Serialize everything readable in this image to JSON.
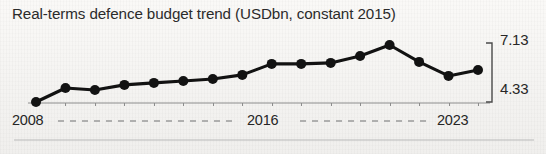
{
  "chart_data": {
    "type": "line",
    "title": "Real-terms defence budget trend (USDbn, constant 2015)",
    "xlabel": "",
    "ylabel": "",
    "grid": false,
    "legend": null,
    "axis_style": "right-bracket",
    "ylim": [
      4.33,
      7.13
    ],
    "y_tick_labels": [
      "4.33",
      "7.13"
    ],
    "x_tick_labels": [
      "2008",
      "2016",
      "2023"
    ],
    "x_tick_connector": "dashed",
    "categories": [
      "2008",
      "2009",
      "2010",
      "2011",
      "2012",
      "2013",
      "2014",
      "2015",
      "2016",
      "2017",
      "2018",
      "2019",
      "2020",
      "2021",
      "2022",
      "2023"
    ],
    "values": [
      4.33,
      5.02,
      4.92,
      5.17,
      5.27,
      5.36,
      5.46,
      5.66,
      6.2,
      6.2,
      6.25,
      6.59,
      7.13,
      6.3,
      5.61,
      5.9
    ],
    "series": [
      {
        "name": "Real-terms defence budget",
        "color": "#121212",
        "marker": "circle",
        "values": [
          4.33,
          5.02,
          4.92,
          5.17,
          5.27,
          5.36,
          5.46,
          5.66,
          6.2,
          6.2,
          6.25,
          6.59,
          7.13,
          6.3,
          5.61,
          5.9
        ]
      }
    ],
    "units": "USDbn, constant 2015"
  },
  "colors": {
    "line": "#121212",
    "marker": "#121212",
    "baseline": "#8c8c8c",
    "bracket": "#4a4a4a",
    "dash": "#9a9a9a",
    "rule": "#b9b9b9",
    "title_text": "#2b2b2b",
    "label_text": "#262626",
    "background": "#f5f4f2"
  },
  "figure": {
    "title": "Real-terms defence budget trend (USDbn, constant 2015)",
    "axis": {
      "max_label": "7.13",
      "min_label": "4.33"
    },
    "x_axis": {
      "start_label": "2008",
      "mid_label": "2016",
      "end_label": "2023"
    }
  }
}
